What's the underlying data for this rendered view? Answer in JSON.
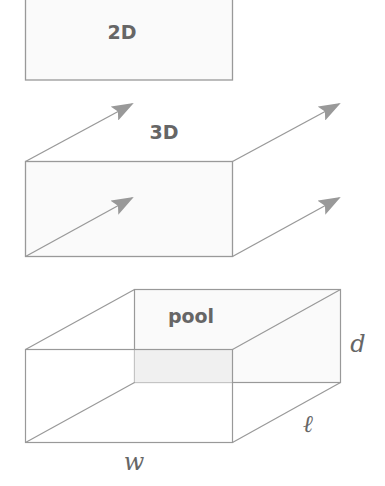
{
  "diagram": {
    "colors": {
      "stroke": "#999999",
      "fill": "#fafafa",
      "arrow": "#999999",
      "text": "#666666",
      "shaded_face": "#f0f0f0"
    },
    "panels": [
      {
        "id": "2d",
        "label": "2D",
        "shape": "rectangle"
      },
      {
        "id": "3d",
        "label": "3D",
        "shape": "rectangle extruded with four depth arrows"
      },
      {
        "id": "pool",
        "label": "pool",
        "shape": "rectangular box (pool)",
        "dimensions": {
          "width": "w",
          "length": "ℓ",
          "depth": "d"
        }
      }
    ]
  }
}
